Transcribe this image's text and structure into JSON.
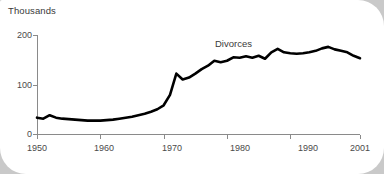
{
  "chart_data": {
    "type": "line",
    "title": "Thousands",
    "xlabel": "",
    "ylabel": "Thousands",
    "grid": false,
    "legend_position": "inline-annotation",
    "annotations": [
      {
        "text": "Divorces",
        "x": 1978,
        "y": 185
      }
    ],
    "xlim": [
      1950,
      2001
    ],
    "ylim": [
      0,
      200
    ],
    "yticks": [
      0,
      100,
      200
    ],
    "ytick_labels": [
      "0",
      "100",
      "200"
    ],
    "xticks": [
      1950,
      1960,
      1970,
      1980,
      1990,
      2001
    ],
    "xtick_labels": [
      "1950",
      "1960",
      "1970",
      "1980",
      "1990",
      "2001"
    ],
    "series": [
      {
        "name": "Divorces",
        "color": "#000000",
        "x": [
          1950,
          1951,
          1952,
          1953,
          1954,
          1955,
          1956,
          1957,
          1958,
          1959,
          1960,
          1961,
          1962,
          1963,
          1964,
          1965,
          1966,
          1967,
          1968,
          1969,
          1970,
          1971,
          1972,
          1973,
          1974,
          1975,
          1976,
          1977,
          1978,
          1979,
          1980,
          1981,
          1982,
          1983,
          1984,
          1985,
          1986,
          1987,
          1988,
          1989,
          1990,
          1991,
          1992,
          1993,
          1994,
          1995,
          1996,
          1997,
          1998,
          1999,
          2000,
          2001
        ],
        "values": [
          33,
          31,
          38,
          33,
          31,
          30,
          29,
          28,
          27,
          27,
          27,
          28,
          29,
          31,
          33,
          35,
          38,
          41,
          45,
          50,
          58,
          79,
          122,
          110,
          114,
          122,
          131,
          138,
          148,
          145,
          148,
          155,
          154,
          157,
          154,
          158,
          152,
          165,
          172,
          165,
          163,
          162,
          163,
          165,
          168,
          173,
          176,
          171,
          168,
          165,
          158,
          153
        ]
      }
    ]
  },
  "chart": {
    "title": "Thousands",
    "series_label": "Divorces",
    "geometry": {
      "x_axis_y": 134,
      "y_axis_x": 37,
      "plot_right": 360,
      "y_top_value_y": 35,
      "y_mid_value_y": 84.5
    }
  }
}
